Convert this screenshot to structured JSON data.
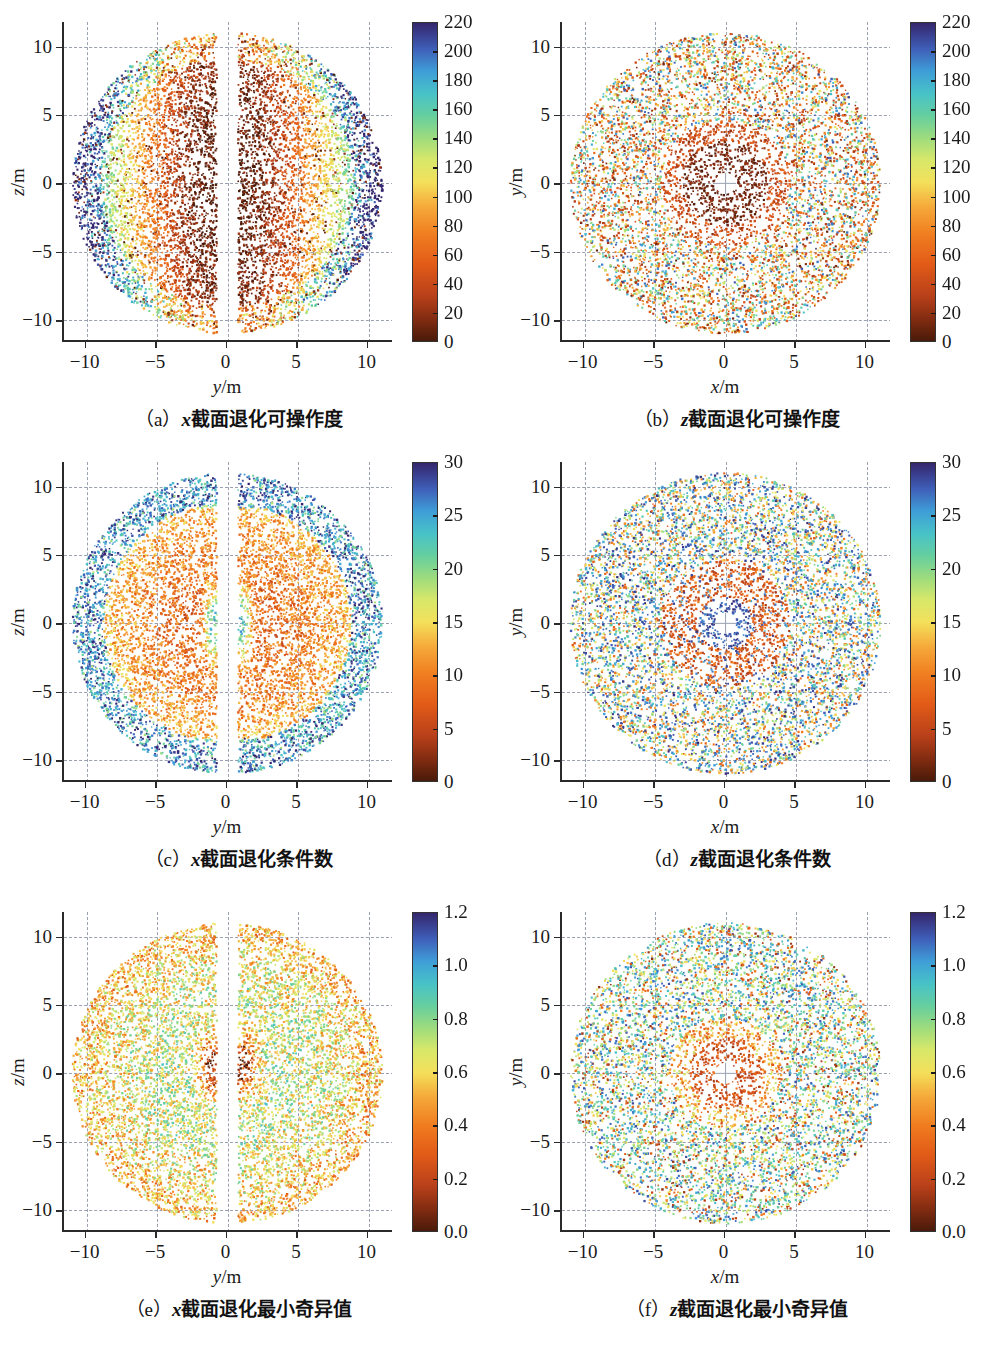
{
  "figure": {
    "columns": 2,
    "rows": 3,
    "background": "#ffffff",
    "colormap_name": "turbo-reversed-spectral",
    "colormap_stops": [
      {
        "t": 0.0,
        "color": "#4a1b0a"
      },
      {
        "t": 0.06,
        "color": "#7c2a10"
      },
      {
        "t": 0.14,
        "color": "#b8401a"
      },
      {
        "t": 0.24,
        "color": "#e25b18"
      },
      {
        "t": 0.33,
        "color": "#f07c20"
      },
      {
        "t": 0.42,
        "color": "#f5a93a"
      },
      {
        "t": 0.5,
        "color": "#f4e05a"
      },
      {
        "t": 0.57,
        "color": "#d8e86a"
      },
      {
        "t": 0.64,
        "color": "#9ddc7e"
      },
      {
        "t": 0.71,
        "color": "#66cfa0"
      },
      {
        "t": 0.78,
        "color": "#48c2c8"
      },
      {
        "t": 0.85,
        "color": "#3f9ed8"
      },
      {
        "t": 0.92,
        "color": "#3f5fb8"
      },
      {
        "t": 1.0,
        "color": "#35276e"
      }
    ]
  },
  "footnote_text": "",
  "chart_data": [
    {
      "id": "a",
      "type": "scatter",
      "title": "",
      "caption_prefix": "（a）",
      "caption_var": "x",
      "caption_text": "截面退化可操作度",
      "caption_full": "（a）x截面退化可操作度",
      "xlabel": "y/m",
      "xlabel_var": "y",
      "ylabel": "z/m",
      "ylabel_var": "z",
      "xlim": [
        -11.6,
        11.8
      ],
      "ylim": [
        -11.6,
        11.8
      ],
      "xticks": [
        -10,
        -5,
        0,
        5,
        10
      ],
      "xticklabels": [
        "−10",
        "−5",
        "0",
        "5",
        "10"
      ],
      "yticks": [
        -10,
        -5,
        0,
        5,
        10
      ],
      "yticklabels": [
        "−10",
        "−5",
        "0",
        "5",
        "10"
      ],
      "grid": true,
      "grid_style": "dashed",
      "colorbar": {
        "vmin": 0,
        "vmax": 220,
        "ticks": [
          0,
          20,
          40,
          60,
          80,
          100,
          120,
          140,
          160,
          180,
          200,
          220
        ],
        "ticklabels": [
          "0",
          "20",
          "40",
          "60",
          "80",
          "100",
          "120",
          "140",
          "160",
          "180",
          "200",
          "220"
        ],
        "position": "right"
      },
      "shape": "x-section",
      "n_points": 9000,
      "radius_outer": 11.0,
      "gap_half_width": 0.75,
      "value_model": "low-near-center-slab"
    },
    {
      "id": "b",
      "type": "scatter",
      "title": "",
      "caption_prefix": "（b）",
      "caption_var": "z",
      "caption_text": "截面退化可操作度",
      "caption_full": "（b）z截面退化可操作度",
      "xlabel": "x/m",
      "xlabel_var": "x",
      "ylabel": "y/m",
      "ylabel_var": "y",
      "xlim": [
        -11.6,
        11.8
      ],
      "ylim": [
        -11.6,
        11.8
      ],
      "xticks": [
        -10,
        -5,
        0,
        5,
        10
      ],
      "xticklabels": [
        "−10",
        "−5",
        "0",
        "5",
        "10"
      ],
      "yticks": [
        -10,
        -5,
        0,
        5,
        10
      ],
      "yticklabels": [
        "−10",
        "−5",
        "0",
        "5",
        "10"
      ],
      "grid": true,
      "grid_style": "dashed",
      "colorbar": {
        "vmin": 0,
        "vmax": 220,
        "ticks": [
          0,
          20,
          40,
          60,
          80,
          100,
          120,
          140,
          160,
          180,
          200,
          220
        ],
        "ticklabels": [
          "0",
          "20",
          "40",
          "60",
          "80",
          "100",
          "120",
          "140",
          "160",
          "180",
          "200",
          "220"
        ],
        "position": "right"
      },
      "shape": "z-section",
      "n_points": 7000,
      "radius_outer": 11.0,
      "hole_radius": 0.75,
      "value_model": "low-near-center-disc"
    },
    {
      "id": "c",
      "type": "scatter",
      "title": "",
      "caption_prefix": "（c）",
      "caption_var": "x",
      "caption_text": "截面退化条件数",
      "caption_full": "（c）x截面退化条件数",
      "xlabel": "y/m",
      "xlabel_var": "y",
      "ylabel": "z/m",
      "ylabel_var": "z",
      "xlim": [
        -11.6,
        11.8
      ],
      "ylim": [
        -11.6,
        11.8
      ],
      "xticks": [
        -10,
        -5,
        0,
        5,
        10
      ],
      "xticklabels": [
        "−10",
        "−5",
        "0",
        "5",
        "10"
      ],
      "yticks": [
        -10,
        -5,
        0,
        5,
        10
      ],
      "yticklabels": [
        "−10",
        "−5",
        "0",
        "5",
        "10"
      ],
      "grid": true,
      "grid_style": "dashed",
      "colorbar": {
        "vmin": 0,
        "vmax": 30,
        "ticks": [
          0,
          5,
          10,
          15,
          20,
          25,
          30
        ],
        "ticklabels": [
          "0",
          "5",
          "10",
          "15",
          "20",
          "25",
          "30"
        ],
        "position": "right"
      },
      "shape": "x-section",
      "n_points": 9000,
      "radius_outer": 11.0,
      "gap_half_width": 0.75,
      "value_model": "high-at-rim-and-slabedge"
    },
    {
      "id": "d",
      "type": "scatter",
      "title": "",
      "caption_prefix": "（d）",
      "caption_var": "z",
      "caption_text": "截面退化条件数",
      "caption_full": "（d）z截面退化条件数",
      "xlabel": "x/m",
      "xlabel_var": "x",
      "ylabel": "y/m",
      "ylabel_var": "y",
      "xlim": [
        -11.6,
        11.8
      ],
      "ylim": [
        -11.6,
        11.8
      ],
      "xticks": [
        -10,
        -5,
        0,
        5,
        10
      ],
      "xticklabels": [
        "−10",
        "−5",
        "0",
        "5",
        "10"
      ],
      "yticks": [
        -10,
        -5,
        0,
        5,
        10
      ],
      "yticklabels": [
        "−10",
        "−5",
        "0",
        "5",
        "10"
      ],
      "grid": true,
      "grid_style": "dashed",
      "colorbar": {
        "vmin": 0,
        "vmax": 30,
        "ticks": [
          0,
          5,
          10,
          15,
          20,
          25,
          30
        ],
        "ticklabels": [
          "0",
          "5",
          "10",
          "15",
          "20",
          "25",
          "30"
        ],
        "position": "right"
      },
      "shape": "z-section",
      "n_points": 7500,
      "radius_outer": 11.0,
      "hole_radius": 0.75,
      "value_model": "high-ring-near-hole-and-rim"
    },
    {
      "id": "e",
      "type": "scatter",
      "title": "",
      "caption_prefix": "（e）",
      "caption_var": "x",
      "caption_text": "截面退化最小奇异值",
      "caption_full": "（e）x截面退化最小奇异值",
      "xlabel": "y/m",
      "xlabel_var": "y",
      "ylabel": "z/m",
      "ylabel_var": "z",
      "xlim": [
        -11.6,
        11.8
      ],
      "ylim": [
        -11.6,
        11.8
      ],
      "xticks": [
        -10,
        -5,
        0,
        5,
        10
      ],
      "xticklabels": [
        "−10",
        "−5",
        "0",
        "5",
        "10"
      ],
      "yticks": [
        -10,
        -5,
        0,
        5,
        10
      ],
      "yticklabels": [
        "−10",
        "−5",
        "0",
        "5",
        "10"
      ],
      "grid": true,
      "grid_style": "dashed",
      "colorbar": {
        "vmin": 0.0,
        "vmax": 1.2,
        "ticks": [
          0.0,
          0.2,
          0.4,
          0.6,
          0.8,
          1.0,
          1.2
        ],
        "ticklabels": [
          "0.0",
          "0.2",
          "0.4",
          "0.6",
          "0.8",
          "1.0",
          "1.2"
        ],
        "position": "right"
      },
      "shape": "x-section",
      "n_points": 9000,
      "radius_outer": 11.0,
      "gap_half_width": 0.75,
      "value_model": "mid-high-mixed-low-at-slabedge"
    },
    {
      "id": "f",
      "type": "scatter",
      "title": "",
      "caption_prefix": "（f）",
      "caption_var": "z",
      "caption_text": "截面退化最小奇异值",
      "caption_full": "（f）z截面退化最小奇异值",
      "xlabel": "x/m",
      "xlabel_var": "x",
      "ylabel": "y/m",
      "ylabel_var": "y",
      "xlim": [
        -11.6,
        11.8
      ],
      "ylim": [
        -11.6,
        11.8
      ],
      "xticks": [
        -10,
        -5,
        0,
        5,
        10
      ],
      "xticklabels": [
        "−10",
        "−5",
        "0",
        "5",
        "10"
      ],
      "yticks": [
        -10,
        -5,
        0,
        5,
        10
      ],
      "yticklabels": [
        "−10",
        "−5",
        "0",
        "5",
        "10"
      ],
      "grid": true,
      "grid_style": "dashed",
      "colorbar": {
        "vmin": 0.0,
        "vmax": 1.2,
        "ticks": [
          0.0,
          0.2,
          0.4,
          0.6,
          0.8,
          1.0,
          1.2
        ],
        "ticklabels": [
          "0.0",
          "0.2",
          "0.4",
          "0.6",
          "0.8",
          "1.0",
          "1.2"
        ],
        "position": "right"
      },
      "shape": "z-section",
      "n_points": 7000,
      "radius_outer": 11.0,
      "hole_radius": 0.75,
      "value_model": "low-ring-near-hole-mid-outside"
    }
  ]
}
